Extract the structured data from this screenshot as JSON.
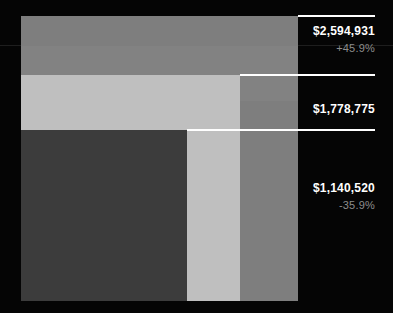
{
  "chart_data": {
    "type": "bar",
    "title": "",
    "subtitle": "",
    "xlabel": "",
    "ylabel": "",
    "grid": false,
    "legend": "none",
    "layout": "nested-overlapping-bars",
    "categories": [
      "Total",
      "Mid",
      "Small"
    ],
    "values": [
      2594931,
      1778775,
      1140520
    ],
    "value_labels": [
      "$2,594,931",
      "$1,778,775",
      "$1,140,520"
    ],
    "deltas": [
      "+45.9%",
      null,
      "-35.9%"
    ],
    "colors": [
      "#7e7e7e",
      "#bfbfbf",
      "#3c3c3c"
    ],
    "background": "#050505",
    "accent": "#ffffff",
    "delta_color": "#8d8d8d",
    "series": [
      {
        "name": "Total",
        "value": 2594931,
        "value_label": "$2,594,931",
        "delta": "+45.9%",
        "color": "#7e7e7e"
      },
      {
        "name": "Mid",
        "value": 1778775,
        "value_label": "$1,778,775",
        "delta": "",
        "color": "#bfbfbf"
      },
      {
        "name": "Small",
        "value": 1140520,
        "value_label": "$1,140,520",
        "delta": "-35.9%",
        "color": "#3c3c3c"
      }
    ]
  },
  "callouts": {
    "total": {
      "value": "$2,594,931",
      "delta": "+45.9%"
    },
    "mid": {
      "value": "$1,778,775",
      "delta": ""
    },
    "small": {
      "value": "$1,140,520",
      "delta": "-35.9%"
    }
  }
}
